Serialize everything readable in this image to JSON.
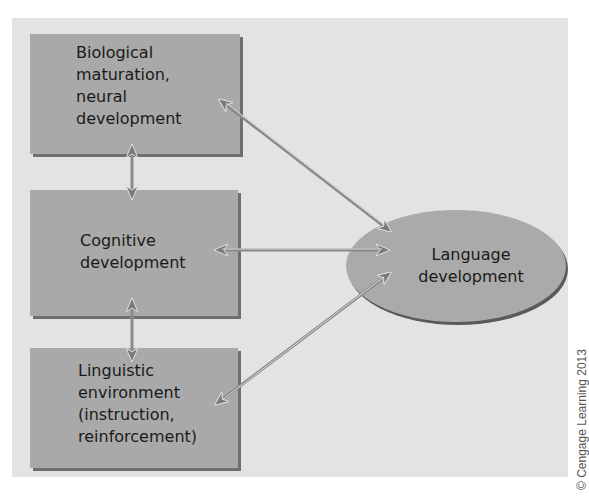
{
  "diagram": {
    "boxes": [
      {
        "id": "biological",
        "lines": [
          "Biological",
          "maturation,",
          "neural",
          "development"
        ]
      },
      {
        "id": "cognitive",
        "lines": [
          "Cognitive",
          "development"
        ]
      },
      {
        "id": "linguistic",
        "lines": [
          "Linguistic",
          "environment",
          "(instruction,",
          "reinforcement)"
        ]
      }
    ],
    "target": {
      "id": "language",
      "lines": [
        "Language",
        "development"
      ]
    },
    "connections": [
      {
        "from": "biological",
        "to": "cognitive",
        "type": "bidirectional"
      },
      {
        "from": "cognitive",
        "to": "linguistic",
        "type": "bidirectional"
      },
      {
        "from": "biological",
        "to": "language",
        "type": "bidirectional"
      },
      {
        "from": "cognitive",
        "to": "language",
        "type": "bidirectional"
      },
      {
        "from": "linguistic",
        "to": "language",
        "type": "bidirectional"
      }
    ],
    "colors": {
      "panel": "#e3e3e3",
      "box": "#a9a9a9",
      "shadow": "#6f6f6f",
      "arrow": "#8a8a8a"
    }
  },
  "credit": "© Cengage Learning 2013"
}
